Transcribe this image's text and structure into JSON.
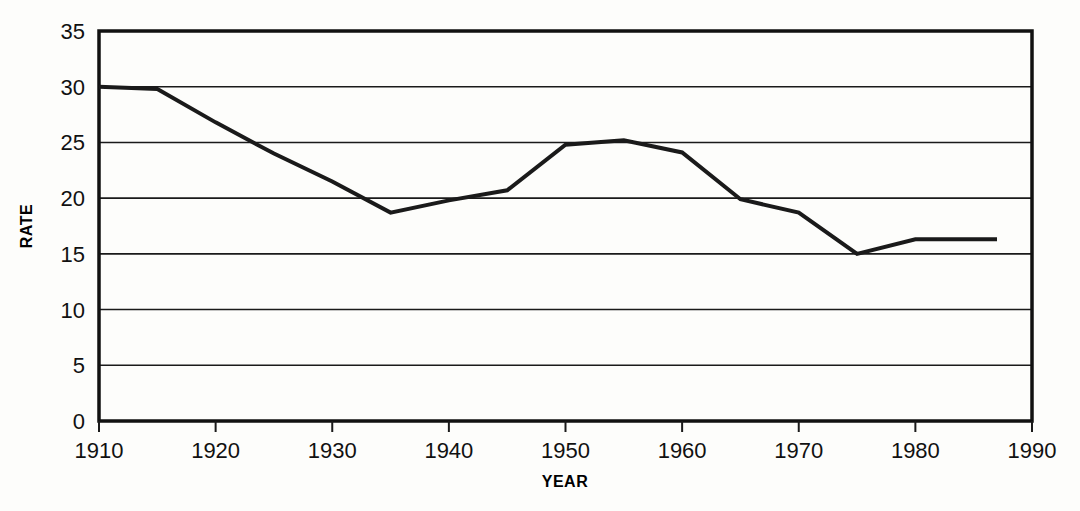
{
  "chart_data": {
    "type": "line",
    "title": "",
    "xlabel": "YEAR",
    "ylabel": "RATE",
    "xlim": [
      1910,
      1990
    ],
    "ylim": [
      0,
      35
    ],
    "xticks": [
      1910,
      1920,
      1930,
      1940,
      1950,
      1960,
      1970,
      1980,
      1990
    ],
    "yticks": [
      0,
      5,
      10,
      15,
      20,
      25,
      30,
      35
    ],
    "grid": "horizontal",
    "legend": "none",
    "line_color": "#1a1a1a",
    "line_width": 4,
    "x": [
      1910,
      1915,
      1920,
      1925,
      1930,
      1935,
      1940,
      1945,
      1950,
      1955,
      1960,
      1965,
      1970,
      1975,
      1980,
      1987
    ],
    "values": [
      30.0,
      29.8,
      26.8,
      24.0,
      21.5,
      18.7,
      19.8,
      20.7,
      24.8,
      25.2,
      24.1,
      19.9,
      18.7,
      15.0,
      16.3,
      16.3
    ],
    "series": [
      {
        "name": "rate",
        "x": [
          1910,
          1915,
          1920,
          1925,
          1930,
          1935,
          1940,
          1945,
          1950,
          1955,
          1960,
          1965,
          1970,
          1975,
          1980,
          1987
        ],
        "values": [
          30.0,
          29.8,
          26.8,
          24.0,
          21.5,
          18.7,
          19.8,
          20.7,
          24.8,
          25.2,
          24.1,
          19.9,
          18.7,
          15.0,
          16.3,
          16.3
        ]
      }
    ]
  },
  "axes": {
    "y_tick_labels": [
      "35",
      "30",
      "25",
      "20",
      "15",
      "10",
      "5",
      "0"
    ],
    "x_tick_labels": [
      "1910",
      "1920",
      "1930",
      "1940",
      "1950",
      "1960",
      "1970",
      "1980",
      "1990"
    ],
    "y_axis_title": "RATE",
    "x_axis_title": "YEAR"
  }
}
